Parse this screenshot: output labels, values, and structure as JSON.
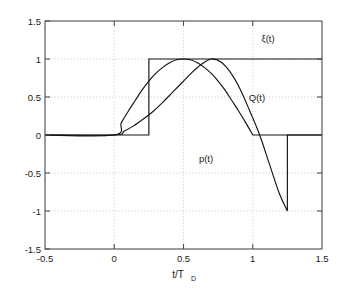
{
  "chart_data": {
    "type": "line",
    "title": "",
    "xlabel": "t/T_D",
    "xlabel_main": "t/T",
    "xlabel_sub": "D",
    "ylabel": "",
    "xlim": [
      -0.5,
      1.5
    ],
    "ylim": [
      -1.5,
      1.5
    ],
    "xticks": [
      -0.5,
      0,
      0.5,
      1,
      1.5
    ],
    "xticklabels": [
      "-0.5",
      "0",
      "0.5",
      "1",
      "1.5"
    ],
    "yticks": [
      -1.5,
      -1,
      -0.5,
      0,
      0.5,
      1,
      1.5
    ],
    "yticklabels": [
      "-1.5",
      "-1",
      "-0.5",
      "0",
      "0.5",
      "1",
      "1.5"
    ],
    "grid": true,
    "grid_style": "dotted",
    "legend_position": "inline-annotations",
    "line_color": "#141414",
    "background_color": "#ffffff",
    "annotations": [
      {
        "text": "ξ(t)",
        "x": 1.18,
        "y": 1.28,
        "name": "xi-curve-label"
      },
      {
        "text": "Q(t)",
        "x": 1.02,
        "y": 0.53,
        "name": "q-curve-label"
      },
      {
        "text": "p(t)",
        "x": 0.66,
        "y": -0.25,
        "name": "p-curve-label"
      }
    ],
    "series": [
      {
        "name": "ξ(t)",
        "description": "unit step switching from 0 to 1 at t/T_D = 0.25, constant thereafter",
        "x": [
          -0.5,
          0.25,
          0.25,
          1.5
        ],
        "y": [
          0,
          0,
          1,
          1
        ]
      },
      {
        "name": "Q(t)",
        "description": "rises from 0 at t=0, peaks at 1 near t=0.5, returns to 0 at t=1, zero thereafter",
        "x": [
          -0.5,
          0,
          0.05,
          0.1,
          0.15,
          0.2,
          0.25,
          0.3,
          0.35,
          0.4,
          0.45,
          0.5,
          0.55,
          0.6,
          0.65,
          0.7,
          0.75,
          0.8,
          0.85,
          0.9,
          0.95,
          1.0,
          1.0,
          1.5
        ],
        "y": [
          0,
          0,
          0.16,
          0.31,
          0.45,
          0.59,
          0.71,
          0.81,
          0.89,
          0.95,
          0.99,
          1.0,
          0.99,
          0.95,
          0.89,
          0.81,
          0.71,
          0.59,
          0.45,
          0.31,
          0.16,
          0.0,
          0,
          0
        ]
      },
      {
        "name": "p(t)",
        "description": "rises from 0 at t=0 to peak 1 near t=0.7, falls through zero, reaches -1 at t=1.25, then jumps back to 0",
        "x": [
          -0.5,
          0,
          0.07,
          0.14,
          0.21,
          0.28,
          0.35,
          0.42,
          0.49,
          0.56,
          0.63,
          0.7,
          0.77,
          0.84,
          0.91,
          0.98,
          1.05,
          1.12,
          1.19,
          1.25,
          1.25,
          1.5
        ],
        "y": [
          0,
          0,
          0.05,
          0.12,
          0.21,
          0.31,
          0.43,
          0.56,
          0.69,
          0.82,
          0.93,
          1.0,
          0.96,
          0.82,
          0.6,
          0.31,
          0.0,
          -0.38,
          -0.76,
          -1.0,
          0,
          0
        ]
      }
    ]
  }
}
